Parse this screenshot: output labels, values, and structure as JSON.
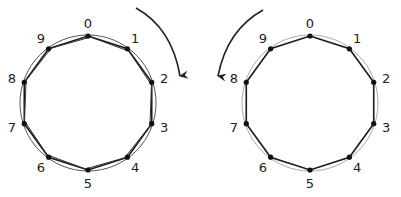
{
  "diagrams": [
    {
      "id": "left",
      "rotation": "clockwise",
      "center": [
        88,
        103
      ],
      "radius": 67,
      "circle_color": "#555555",
      "double_polygon": true,
      "labels": [
        "0",
        "1",
        "2",
        "3",
        "4",
        "5",
        "6",
        "7",
        "8",
        "9"
      ],
      "arrow_path": "M136 8 Q172 28 180 76"
    },
    {
      "id": "right",
      "rotation": "counterclockwise",
      "center": [
        310,
        103
      ],
      "radius": 67,
      "circle_color": "#aaaaaa",
      "double_polygon": false,
      "labels": [
        "0",
        "1",
        "2",
        "3",
        "4",
        "5",
        "6",
        "7",
        "8",
        "9"
      ],
      "arrow_path": "M263 10 Q227 30 218 76"
    }
  ],
  "colors": {
    "stroke": "#1a1a1a",
    "node": "#111111"
  }
}
